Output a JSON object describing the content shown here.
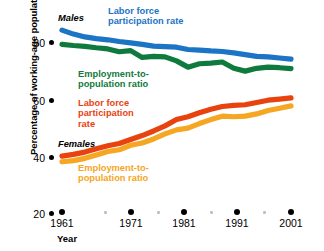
{
  "chart_data": {
    "type": "line",
    "title": "",
    "xlabel": "Year",
    "ylabel": "Percentage of working-age population",
    "xlim": [
      1961,
      2001
    ],
    "ylim": [
      20,
      85
    ],
    "yticks": [
      80,
      60,
      40,
      20
    ],
    "xticks": [
      1961,
      1971,
      1981,
      1991,
      2001
    ],
    "xminor_ticks": [
      1966,
      1976,
      1986,
      1996
    ],
    "grid": false,
    "legend_position": "inline-annotations",
    "group_labels": [
      "Males",
      "Females"
    ],
    "x": [
      1961,
      1963,
      1965,
      1967,
      1969,
      1971,
      1973,
      1975,
      1977,
      1979,
      1981,
      1983,
      1985,
      1987,
      1989,
      1991,
      1993,
      1995,
      1997,
      1999,
      2001
    ],
    "series": [
      {
        "name": "Labor force participation rate",
        "group": "Males",
        "color": "#1b74c4",
        "values": [
          84.0,
          82.6,
          81.6,
          81.0,
          80.6,
          80.0,
          79.5,
          79.0,
          78.4,
          78.2,
          78.0,
          77.2,
          77.0,
          76.7,
          76.5,
          76.0,
          75.4,
          74.8,
          74.6,
          74.2,
          73.8
        ]
      },
      {
        "name": "Employment-to-population ratio",
        "group": "Males",
        "color": "#0f7a3d",
        "values": [
          79.0,
          78.6,
          78.3,
          77.8,
          77.4,
          76.4,
          76.8,
          74.4,
          74.8,
          74.6,
          73.2,
          71.0,
          72.2,
          72.4,
          72.8,
          70.6,
          69.6,
          70.6,
          71.0,
          70.8,
          70.5
        ]
      },
      {
        "name": "Labor force participation rate",
        "group": "Females",
        "color": "#e8430f",
        "values": [
          39.8,
          40.4,
          41.2,
          42.4,
          43.4,
          44.2,
          45.6,
          47.0,
          48.6,
          50.4,
          52.6,
          53.6,
          55.0,
          56.2,
          57.2,
          57.6,
          57.8,
          58.6,
          59.4,
          59.8,
          60.2
        ]
      },
      {
        "name": "Employment-to-population ratio",
        "group": "Females",
        "color": "#f5a623",
        "values": [
          37.8,
          38.2,
          39.0,
          40.2,
          41.4,
          42.0,
          43.6,
          44.4,
          45.8,
          47.6,
          49.0,
          49.6,
          51.2,
          52.6,
          53.8,
          53.6,
          53.8,
          54.6,
          55.8,
          56.6,
          57.4
        ]
      }
    ]
  },
  "axes": {
    "y_axis_title": "Percentage of working-age population",
    "y_tick_labels": [
      "80",
      "60",
      "40",
      "20"
    ],
    "x_axis_title": "Year",
    "x_tick_labels": [
      "1961",
      "1971",
      "1981",
      "1991",
      "2001"
    ]
  },
  "annotations": {
    "males_group": "Males",
    "females_group": "Females",
    "males_lfpr": "Labor force\nparticipation rate",
    "males_lfpr_line1": "Labor force",
    "males_lfpr_line2": "participation rate",
    "males_epr_line1": "Employment-to-",
    "males_epr_line2": "population ratio",
    "females_lfpr_line1": "Labor force",
    "females_lfpr_line2": "participation",
    "females_lfpr_line3": "rate",
    "females_epr_line1": "Employment-to-",
    "females_epr_line2": "population ratio"
  },
  "colors": {
    "males_lfpr": "#1b74c4",
    "males_epr": "#0f7a3d",
    "females_lfpr": "#e8430f",
    "females_epr": "#f5a623",
    "text": "#000000",
    "background": "#ffffff"
  }
}
